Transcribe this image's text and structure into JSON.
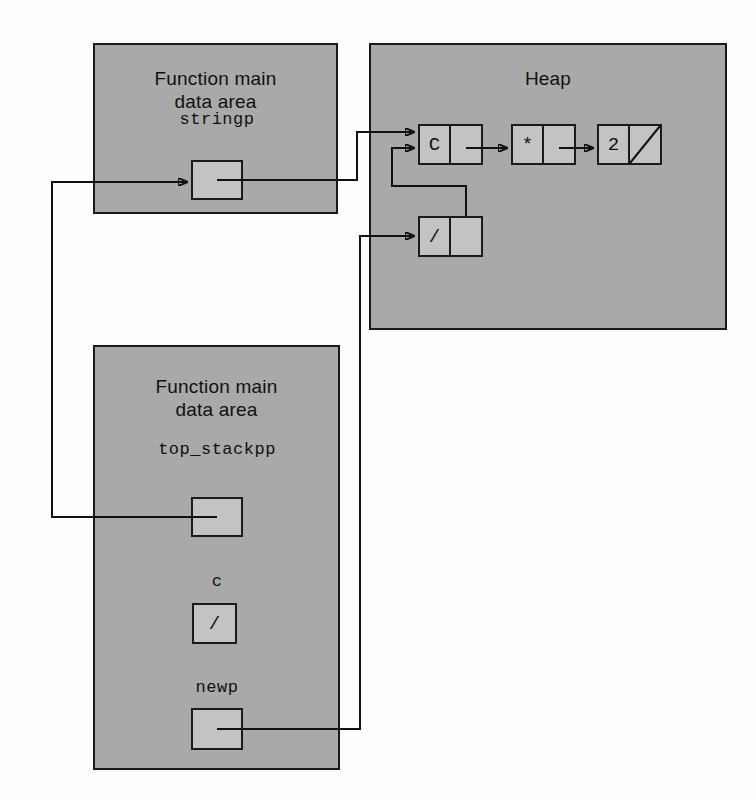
{
  "diagram": {
    "regions": [
      {
        "id": "main-top",
        "title": "Function main\ndata area",
        "x": 93,
        "y": 43,
        "w": 245,
        "h": 171,
        "title_y": 22
      },
      {
        "id": "heap",
        "title": "Heap",
        "x": 369,
        "y": 43,
        "w": 358,
        "h": 287,
        "title_y": 22
      },
      {
        "id": "main-bottom",
        "title": "Function main\ndata area",
        "x": 93,
        "y": 345,
        "w": 247,
        "h": 425,
        "title_y": 28
      }
    ],
    "variables": [
      {
        "id": "stringp",
        "label": "stringp",
        "label_x": 167,
        "label_y": 110,
        "label_w": 100,
        "box_x": 191,
        "box_y": 160,
        "box_w": 52,
        "box_h": 40,
        "value": "",
        "kind": "pointer"
      },
      {
        "id": "top_stackpp",
        "label": "top_stackpp",
        "label_x": 142,
        "label_y": 440,
        "label_w": 150,
        "box_x": 191,
        "box_y": 497,
        "box_w": 52,
        "box_h": 40,
        "value": "",
        "kind": "pointer"
      },
      {
        "id": "c",
        "label": "c",
        "label_x": 192,
        "label_y": 572,
        "label_w": 50,
        "box_x": 192,
        "box_y": 603,
        "box_w": 45,
        "box_h": 41,
        "value": "/",
        "kind": "char"
      },
      {
        "id": "newp",
        "label": "newp",
        "label_x": 172,
        "label_y": 678,
        "label_w": 90,
        "box_x": 191,
        "box_y": 708,
        "box_w": 52,
        "box_h": 42,
        "value": "",
        "kind": "pointer"
      }
    ],
    "heap_nodes": [
      {
        "id": "node-c",
        "value": "C",
        "x": 418,
        "y": 124,
        "w": 65,
        "h": 41,
        "next": "node-star",
        "null_next": false
      },
      {
        "id": "node-star",
        "value": "*",
        "x": 511,
        "y": 124,
        "w": 65,
        "h": 41,
        "next": "node-2",
        "null_next": false
      },
      {
        "id": "node-2",
        "value": "2",
        "x": 597,
        "y": 124,
        "w": 65,
        "h": 41,
        "next": null,
        "null_next": true
      },
      {
        "id": "node-slash",
        "value": "/",
        "x": 418,
        "y": 216,
        "w": 65,
        "h": 41,
        "next": "node-c",
        "null_next": false
      }
    ],
    "connections": [
      {
        "id": "stringp-to-node-c",
        "from": "stringp",
        "to": "node-c"
      },
      {
        "id": "top_stackpp-to-stringp",
        "from": "top_stackpp",
        "to": "stringp"
      },
      {
        "id": "newp-to-node-slash",
        "from": "newp",
        "to": "node-slash"
      },
      {
        "id": "node-slash-to-node-c",
        "from": "node-slash",
        "to": "node-c"
      },
      {
        "id": "node-c-to-node-star",
        "from": "node-c",
        "to": "node-star"
      },
      {
        "id": "node-star-to-node-2",
        "from": "node-star",
        "to": "node-2"
      }
    ]
  }
}
